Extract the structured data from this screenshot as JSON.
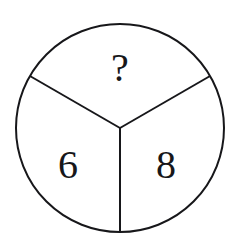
{
  "figure": {
    "name": "three-sector-circle-puzzle",
    "background_color": "#ffffff",
    "stroke_color": "#17171a",
    "text_color": "#17171a",
    "stroke_width": 2,
    "circle": {
      "center_x": 120,
      "center_y": 128,
      "radius": 104
    },
    "spokes": [
      {
        "name": "spoke-down",
        "angle_deg": 90
      },
      {
        "name": "spoke-upper-left",
        "angle_deg": 210
      },
      {
        "name": "spoke-upper-right",
        "angle_deg": 330
      }
    ],
    "sectors": [
      {
        "name": "top-sector",
        "label": "?",
        "label_x": 120,
        "label_y": 72,
        "font_size": 40
      },
      {
        "name": "bottom-left-sector",
        "label": "6",
        "label_x": 68,
        "label_y": 169,
        "font_size": 40
      },
      {
        "name": "bottom-right-sector",
        "label": "8",
        "label_x": 166,
        "label_y": 169,
        "font_size": 40
      }
    ]
  }
}
